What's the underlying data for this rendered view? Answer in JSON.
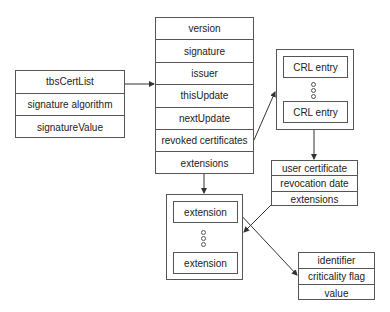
{
  "diagram": {
    "crl": {
      "rows": [
        "tbsCertList",
        "signature algorithm",
        "signatureValue"
      ]
    },
    "tbs_cert_list": {
      "rows": [
        "version",
        "signature",
        "issuer",
        "thisUpdate",
        "nextUpdate",
        "revoked certificates",
        "extensions"
      ]
    },
    "revoked_list": {
      "first_entry": "CRL entry",
      "last_entry": "CRL entry"
    },
    "crl_entry": {
      "rows": [
        "user certificate",
        "revocation date",
        "extensions"
      ]
    },
    "extensions_list": {
      "first_entry": "extension",
      "last_entry": "extension"
    },
    "extension": {
      "rows": [
        "identifier",
        "criticality flag",
        "value"
      ]
    },
    "connections": [
      {
        "from": "tbsCertList",
        "to": "tbs-cert-list-box"
      },
      {
        "from": "revoked certificates",
        "to": "revoked-list-container"
      },
      {
        "from": "CRL entry",
        "to": "crl-entry-box"
      },
      {
        "from": "extensions",
        "to": "extensions-list-container"
      },
      {
        "from": "crl-entry extensions",
        "to": "extensions-list-container"
      },
      {
        "from": "extension",
        "to": "extension-box"
      }
    ]
  }
}
